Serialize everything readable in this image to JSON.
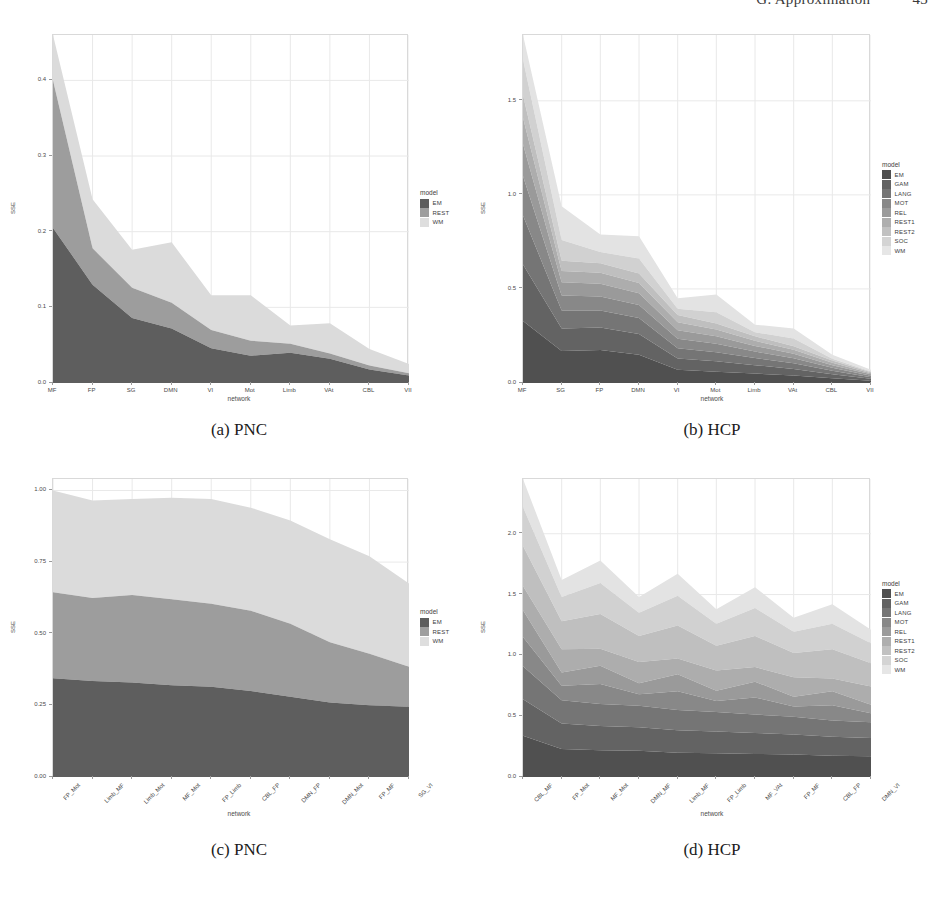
{
  "running_head": {
    "left": "",
    "text": "G. Approximation",
    "page": "43"
  },
  "figure": {
    "panels": [
      {
        "id": "a",
        "caption": "(a) PNC",
        "legend_title": "model",
        "y_axis_label": "SSE",
        "x_axis_label": "network"
      },
      {
        "id": "b",
        "caption": "(b) HCP",
        "legend_title": "model",
        "y_axis_label": "SSE",
        "x_axis_label": "network"
      },
      {
        "id": "c",
        "caption": "(c) PNC",
        "legend_title": "model",
        "y_axis_label": "SSE",
        "x_axis_label": "network"
      },
      {
        "id": "d",
        "caption": "(d) HCP",
        "legend_title": "model",
        "y_axis_label": "SSE",
        "x_axis_label": "network"
      }
    ]
  },
  "colors": {
    "grey_scale_3": [
      "#5d5d5d",
      "#9e9e9e",
      "#dedede"
    ],
    "grey_scale_9": [
      "#4f4f4f",
      "#626262",
      "#757575",
      "#888888",
      "#9b9b9b",
      "#aeaeae",
      "#c1c1c1",
      "#d4d4d4",
      "#e6e6e6"
    ],
    "panel_border": "#d9d9d9",
    "grid": "#ececec",
    "text": "#4a4a4a"
  },
  "chart_data": [
    {
      "type": "area",
      "panel": "a",
      "title": "(a) PNC",
      "xlabel": "network",
      "ylabel": "SSE",
      "categories": [
        "MF",
        "FP",
        "SG",
        "DMN",
        "VI",
        "Mot",
        "Limb",
        "VAt",
        "CBL",
        "VII"
      ],
      "ytick_labels": [
        "0.0",
        "0.1",
        "0.2",
        "0.3",
        "0.4"
      ],
      "ytick_values": [
        0.0,
        0.1,
        0.2,
        0.3,
        0.4
      ],
      "ylim": [
        0,
        0.46
      ],
      "grid": true,
      "legend_position": "right",
      "series": [
        {
          "name": "EM",
          "values": [
            0.205,
            0.13,
            0.086,
            0.072,
            0.046,
            0.036,
            0.04,
            0.032,
            0.018,
            0.01
          ]
        },
        {
          "name": "REST",
          "values": [
            0.195,
            0.048,
            0.04,
            0.034,
            0.024,
            0.02,
            0.012,
            0.007,
            0.005,
            0.003
          ]
        },
        {
          "name": "WM",
          "values": [
            0.06,
            0.065,
            0.05,
            0.08,
            0.046,
            0.06,
            0.024,
            0.04,
            0.022,
            0.012
          ]
        }
      ],
      "totals": [
        0.46,
        0.243,
        0.176,
        0.186,
        0.116,
        0.116,
        0.076,
        0.079,
        0.045,
        0.025
      ]
    },
    {
      "type": "area",
      "panel": "b",
      "title": "(b) HCP",
      "xlabel": "network",
      "ylabel": "SSE",
      "categories": [
        "MF",
        "SG",
        "FP",
        "DMN",
        "VI",
        "Mot",
        "Limb",
        "VAt",
        "CBL",
        "VII"
      ],
      "ytick_labels": [
        "0.0",
        "0.5",
        "1.0",
        "1.5"
      ],
      "ytick_values": [
        0.0,
        0.5,
        1.0,
        1.5
      ],
      "ylim": [
        0,
        1.85
      ],
      "grid": true,
      "legend_position": "right",
      "series": [
        {
          "name": "EM",
          "values": [
            0.33,
            0.17,
            0.175,
            0.15,
            0.07,
            0.06,
            0.05,
            0.04,
            0.025,
            0.012
          ]
        },
        {
          "name": "GAM",
          "values": [
            0.3,
            0.12,
            0.12,
            0.11,
            0.06,
            0.055,
            0.045,
            0.035,
            0.022,
            0.01
          ]
        },
        {
          "name": "LANG",
          "values": [
            0.26,
            0.095,
            0.09,
            0.085,
            0.055,
            0.048,
            0.038,
            0.03,
            0.018,
            0.009
          ]
        },
        {
          "name": "MOT",
          "values": [
            0.21,
            0.08,
            0.075,
            0.07,
            0.05,
            0.045,
            0.034,
            0.026,
            0.016,
            0.008
          ]
        },
        {
          "name": "REL",
          "values": [
            0.17,
            0.07,
            0.068,
            0.062,
            0.046,
            0.04,
            0.03,
            0.024,
            0.014,
            0.007
          ]
        },
        {
          "name": "REST1",
          "values": [
            0.14,
            0.06,
            0.058,
            0.055,
            0.042,
            0.036,
            0.027,
            0.022,
            0.013,
            0.006
          ]
        },
        {
          "name": "REST2",
          "values": [
            0.12,
            0.055,
            0.05,
            0.05,
            0.038,
            0.032,
            0.024,
            0.019,
            0.011,
            0.005
          ]
        },
        {
          "name": "SOC",
          "values": [
            0.19,
            0.11,
            0.06,
            0.08,
            0.034,
            0.06,
            0.022,
            0.04,
            0.01,
            0.004
          ]
        },
        {
          "name": "WM",
          "values": [
            0.13,
            0.18,
            0.094,
            0.118,
            0.055,
            0.094,
            0.04,
            0.054,
            0.021,
            0.009
          ]
        }
      ],
      "totals": [
        1.85,
        0.94,
        0.79,
        0.78,
        0.45,
        0.47,
        0.31,
        0.29,
        0.15,
        0.07
      ]
    },
    {
      "type": "area",
      "panel": "c",
      "title": "(c) PNC",
      "xlabel": "network",
      "ylabel": "SSE",
      "categories": [
        "FP_Mot",
        "Limb_MF",
        "Limb_Mot",
        "MF_Mot",
        "FP_Limb",
        "CBL_FP",
        "DMN_FP",
        "DMN_Mot",
        "FP_MF",
        "SG_VI"
      ],
      "ytick_labels": [
        "0.00",
        "0.25",
        "0.50",
        "0.75",
        "1.00"
      ],
      "ytick_values": [
        0.0,
        0.25,
        0.5,
        0.75,
        1.0
      ],
      "ylim": [
        0,
        1.04
      ],
      "grid": true,
      "legend_position": "right",
      "series": [
        {
          "name": "EM",
          "values": [
            0.345,
            0.335,
            0.33,
            0.32,
            0.315,
            0.3,
            0.28,
            0.26,
            0.25,
            0.245
          ]
        },
        {
          "name": "REST",
          "values": [
            0.3,
            0.29,
            0.305,
            0.3,
            0.29,
            0.28,
            0.255,
            0.21,
            0.18,
            0.14
          ]
        },
        {
          "name": "WM",
          "values": [
            0.355,
            0.34,
            0.335,
            0.355,
            0.365,
            0.36,
            0.36,
            0.36,
            0.34,
            0.29
          ]
        }
      ],
      "totals": [
        1.0,
        0.965,
        0.97,
        0.975,
        0.97,
        0.94,
        0.895,
        0.83,
        0.77,
        0.675
      ]
    },
    {
      "type": "area",
      "panel": "d",
      "title": "(d) HCP",
      "xlabel": "network",
      "ylabel": "SSE",
      "categories": [
        "CBL_MF",
        "FP_Mot",
        "MF_Mot",
        "DMN_MF",
        "Limb_MF",
        "FP_Limb",
        "MF_VAt",
        "FP_MF",
        "CBL_FP",
        "DMN_VI"
      ],
      "ytick_labels": [
        "0.0",
        "0.5",
        "1.0",
        "1.5",
        "2.0"
      ],
      "ytick_values": [
        0.0,
        0.5,
        1.0,
        1.5,
        2.0
      ],
      "ylim": [
        0,
        2.45
      ],
      "grid": true,
      "legend_position": "right",
      "series": [
        {
          "name": "EM",
          "values": [
            0.34,
            0.23,
            0.22,
            0.215,
            0.2,
            0.195,
            0.19,
            0.185,
            0.175,
            0.17
          ]
        },
        {
          "name": "GAM",
          "values": [
            0.3,
            0.21,
            0.2,
            0.195,
            0.185,
            0.18,
            0.172,
            0.165,
            0.155,
            0.15
          ]
        },
        {
          "name": "LANG",
          "values": [
            0.27,
            0.19,
            0.18,
            0.175,
            0.165,
            0.16,
            0.152,
            0.145,
            0.135,
            0.13
          ]
        },
        {
          "name": "MOT",
          "values": [
            0.24,
            0.12,
            0.165,
            0.095,
            0.155,
            0.09,
            0.14,
            0.085,
            0.125,
            0.075
          ]
        },
        {
          "name": "REL",
          "values": [
            0.22,
            0.11,
            0.15,
            0.09,
            0.14,
            0.085,
            0.13,
            0.08,
            0.115,
            0.07
          ]
        },
        {
          "name": "REST1",
          "values": [
            0.2,
            0.19,
            0.14,
            0.175,
            0.13,
            0.165,
            0.12,
            0.16,
            0.105,
            0.15
          ]
        },
        {
          "name": "REST2",
          "values": [
            0.33,
            0.23,
            0.285,
            0.215,
            0.27,
            0.205,
            0.255,
            0.2,
            0.24,
            0.19
          ]
        },
        {
          "name": "SOC",
          "values": [
            0.32,
            0.2,
            0.255,
            0.19,
            0.245,
            0.18,
            0.23,
            0.175,
            0.21,
            0.165
          ]
        },
        {
          "name": "WM",
          "values": [
            0.23,
            0.14,
            0.185,
            0.13,
            0.18,
            0.12,
            0.171,
            0.115,
            0.16,
            0.11
          ]
        }
      ],
      "totals": [
        2.45,
        1.62,
        1.78,
        1.48,
        1.67,
        1.38,
        1.56,
        1.31,
        1.42,
        1.21
      ]
    }
  ],
  "legends": {
    "three_model": {
      "title": "model",
      "items": [
        "EM",
        "REST",
        "WM"
      ]
    },
    "nine_model": {
      "title": "model",
      "items": [
        "EM",
        "GAM",
        "LANG",
        "MOT",
        "REL",
        "REST1",
        "REST2",
        "SOC",
        "WM"
      ]
    }
  }
}
